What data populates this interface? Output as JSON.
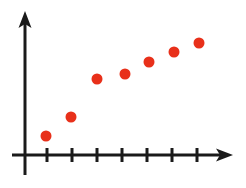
{
  "figure": {
    "title": "",
    "background_color": "#FFFFFF",
    "width": 246,
    "height": 188
  },
  "axes": {
    "axis_color": "#1A1A1A",
    "axis_line_width": 3,
    "y_axis": {
      "name": "y-axis",
      "x": 25,
      "top": 11,
      "bottom": 175,
      "has_arrow": true,
      "arrow_direction": "up",
      "label": "",
      "tick_labels": []
    },
    "x_axis": {
      "name": "x-axis",
      "y": 155,
      "left": 12,
      "right": 233,
      "has_arrow": true,
      "arrow_direction": "right",
      "label": "",
      "tick_count": 7,
      "tick_positions": [
        47,
        72,
        97,
        122,
        147,
        172,
        197
      ],
      "tick_half_length": 7,
      "tick_labels": []
    },
    "grid": "off",
    "legend": "none"
  },
  "chart_data": {
    "type": "scatter",
    "title": "",
    "xlabel": "",
    "ylabel": "",
    "grid": false,
    "legend": null,
    "point_color": "#E8301A",
    "point_radius": 5.5,
    "xlim": [
      0,
      8
    ],
    "ylim": [
      0,
      8
    ],
    "series": [
      {
        "name": "series-1",
        "x": [
          1,
          2,
          3,
          4,
          5,
          6,
          7
        ],
        "y": [
          1.0,
          2.0,
          3.8,
          4.2,
          5.4,
          6.4,
          7.2
        ],
        "px": [
          46,
          71,
          97,
          125,
          149,
          174,
          199
        ],
        "py": [
          136,
          117,
          79,
          74,
          62,
          52,
          43
        ]
      }
    ],
    "points": [
      {
        "label": "point-1",
        "x": 1,
        "y": 1.0,
        "px": 46,
        "py": 136
      },
      {
        "label": "point-2",
        "x": 2,
        "y": 2.0,
        "px": 71,
        "py": 117
      },
      {
        "label": "point-3",
        "x": 3,
        "y": 3.8,
        "px": 97,
        "py": 79
      },
      {
        "label": "point-4",
        "x": 4,
        "y": 4.2,
        "px": 125,
        "py": 74
      },
      {
        "label": "point-5",
        "x": 5,
        "y": 5.4,
        "px": 149,
        "py": 62
      },
      {
        "label": "point-6",
        "x": 6,
        "y": 6.4,
        "px": 174,
        "py": 52
      },
      {
        "label": "point-7",
        "x": 7,
        "y": 7.2,
        "px": 199,
        "py": 43
      }
    ]
  }
}
